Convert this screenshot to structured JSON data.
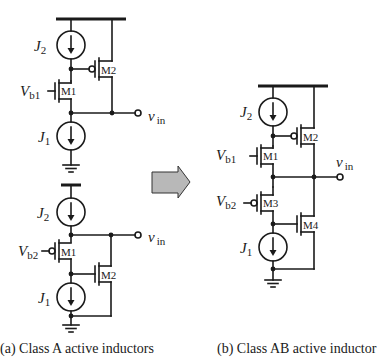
{
  "figure": {
    "panel_a": {
      "caption": "(a) Class A active inductors",
      "circuit_top": {
        "current_sources": [
          {
            "name": "J",
            "sub": "2"
          },
          {
            "name": "J",
            "sub": "1"
          }
        ],
        "bias": {
          "name": "V",
          "sub": "b1"
        },
        "transistors": [
          "M1",
          "M2"
        ],
        "output": {
          "name": "v",
          "sub": "in"
        }
      },
      "circuit_bottom": {
        "current_sources": [
          {
            "name": "J",
            "sub": "2"
          },
          {
            "name": "J",
            "sub": "1"
          }
        ],
        "bias": {
          "name": "V",
          "sub": "b2"
        },
        "transistors": [
          "M1",
          "M2"
        ],
        "output": {
          "name": "v",
          "sub": "in"
        }
      }
    },
    "arrow": {
      "color": "#b8b8b8",
      "direction": "right"
    },
    "panel_b": {
      "caption": "(b) Class AB active inductor",
      "current_sources": [
        {
          "name": "J",
          "sub": "2"
        },
        {
          "name": "J",
          "sub": "1"
        }
      ],
      "bias": [
        {
          "name": "V",
          "sub": "b1"
        },
        {
          "name": "V",
          "sub": "b2"
        }
      ],
      "transistors": [
        "M1",
        "M2",
        "M3",
        "M4"
      ],
      "output": {
        "name": "v",
        "sub": "in"
      }
    }
  }
}
